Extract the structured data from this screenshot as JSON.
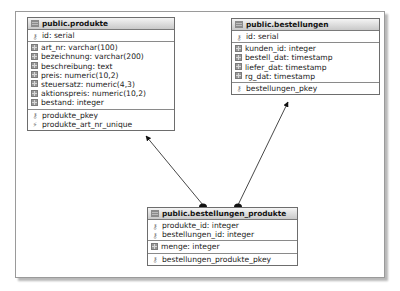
{
  "diagram": {
    "tables": [
      {
        "id": "produkte",
        "title": "public.produkte",
        "key_columns": [
          {
            "label": "id: serial",
            "icon": "key-icon"
          }
        ],
        "columns": [
          {
            "label": "art_nr: varchar(100)",
            "icon": "column-icon"
          },
          {
            "label": "bezeichnung: varchar(200)",
            "icon": "column-icon"
          },
          {
            "label": "beschreibung: text",
            "icon": "column-icon"
          },
          {
            "label": "preis: numeric(10,2)",
            "icon": "column-icon"
          },
          {
            "label": "steuersatz: numeric(4,3)",
            "icon": "column-icon"
          },
          {
            "label": "aktionspreis: numeric(10,2)",
            "icon": "column-icon"
          },
          {
            "label": "bestand: integer",
            "icon": "column-icon"
          }
        ],
        "constraints": [
          {
            "label": "produkte_pkey",
            "icon": "key-icon"
          },
          {
            "label": "produkte_art_nr_unique",
            "icon": "unique-constraint-icon"
          }
        ]
      },
      {
        "id": "bestellungen",
        "title": "public.bestellungen",
        "key_columns": [
          {
            "label": "id: serial",
            "icon": "key-icon"
          }
        ],
        "columns": [
          {
            "label": "kunden_id: integer",
            "icon": "column-icon"
          },
          {
            "label": "bestell_dat: timestamp",
            "icon": "column-icon"
          },
          {
            "label": "liefer_dat: timestamp",
            "icon": "column-icon"
          },
          {
            "label": "rg_dat: timestamp",
            "icon": "column-icon"
          }
        ],
        "constraints": [
          {
            "label": "bestellungen_pkey",
            "icon": "key-icon"
          }
        ]
      },
      {
        "id": "bestellungen_produkte",
        "title": "public.bestellungen_produkte",
        "key_columns": [
          {
            "label": "produkte_id: integer",
            "icon": "key-icon"
          },
          {
            "label": "bestellungen_id: integer",
            "icon": "key-icon"
          }
        ],
        "columns": [
          {
            "label": "menge: integer",
            "icon": "column-icon"
          }
        ],
        "constraints": [
          {
            "label": "bestellungen_produkte_pkey",
            "icon": "key-icon"
          }
        ]
      }
    ],
    "relationships": [
      {
        "from": "bestellungen_produkte",
        "to": "produkte"
      },
      {
        "from": "bestellungen_produkte",
        "to": "bestellungen"
      }
    ],
    "colors": {
      "table_border": "#6d6d6d",
      "header_top": "#f4f4f4",
      "header_bottom": "#c9c9c9",
      "line": "#333333"
    }
  }
}
